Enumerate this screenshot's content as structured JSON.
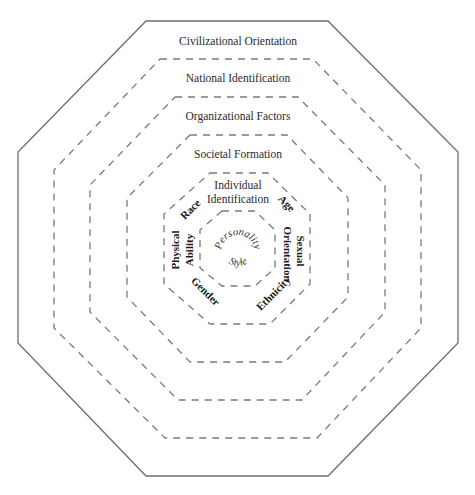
{
  "diagram": {
    "type": "nested-octagons",
    "rings": [
      {
        "level": 1,
        "label": "Civilizational Orientation",
        "border": "solid"
      },
      {
        "level": 2,
        "label": "National Identification",
        "border": "dashed"
      },
      {
        "level": 3,
        "label": "Organizational Factors",
        "border": "dashed"
      },
      {
        "level": 4,
        "label": "Societal Formation",
        "border": "dashed"
      },
      {
        "level": 5,
        "label_line1": "Individual",
        "label_line2": "Identification",
        "border": "dashed"
      },
      {
        "level": 6,
        "label_top": "Personality",
        "label_bottom": "Style",
        "border": "dashed"
      }
    ],
    "individual_factors": {
      "race": "Race",
      "age": "Age",
      "physical_line1": "Physical",
      "physical_line2": "Ability",
      "sexual_line1": "Sexual",
      "sexual_line2": "Orientation",
      "gender": "Gender",
      "ethnicity": "Ethnicity"
    }
  }
}
